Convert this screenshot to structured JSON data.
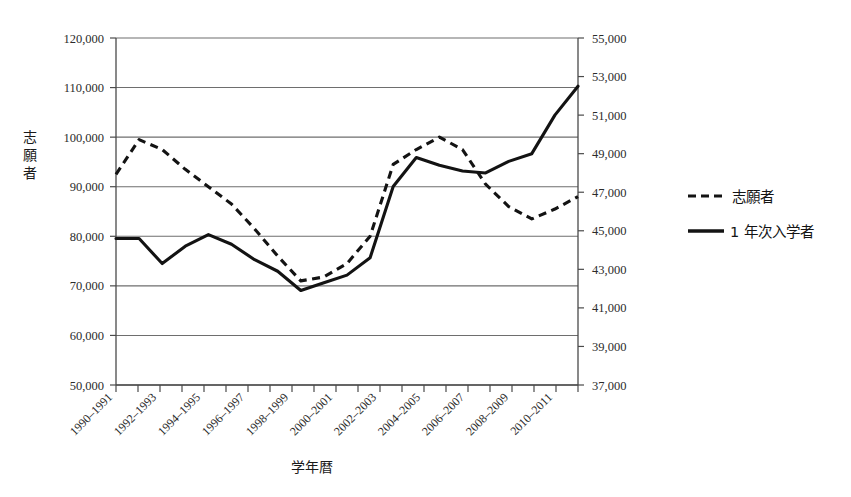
{
  "chart_data": {
    "type": "line",
    "title": "",
    "xlabel": "学年暦",
    "ylabel": "志願者",
    "ylabel_right": "",
    "grid": true,
    "legend_position": "right",
    "x": [
      "1990-1991",
      "1991-1992",
      "1992-1993",
      "1993-1994",
      "1994-1995",
      "1995-1996",
      "1996-1997",
      "1997-1998",
      "1998-1999",
      "1999-2000",
      "2000-2001",
      "2001-2002",
      "2002-2003",
      "2003-2004",
      "2004-2005",
      "2005-2006",
      "2006-2007",
      "2007-2008",
      "2008-2009",
      "2009-2010",
      "2010-2011"
    ],
    "xtick_labels": [
      "1990–1991",
      "1992–1993",
      "1994–1995",
      "1996–1997",
      "1998–1999",
      "2000–2001",
      "2002–2003",
      "2004–2005",
      "2006–2007",
      "2008–2009",
      "2010–2011"
    ],
    "ylim": [
      50000,
      120000
    ],
    "yticks": [
      "50,000",
      "60,000",
      "70,000",
      "80,000",
      "90,000",
      "100,000",
      "110,000",
      "120,000"
    ],
    "ylim_right": [
      37000,
      55000
    ],
    "yticks_right": [
      "37,000",
      "39,000",
      "41,000",
      "43,000",
      "45,000",
      "47,000",
      "49,000",
      "51,000",
      "53,000",
      "55,000"
    ],
    "series": [
      {
        "name": "志願者",
        "style": "dashed",
        "axis": "left",
        "values": [
          92500,
          99500,
          97500,
          93500,
          90000,
          86500,
          81500,
          76000,
          71000,
          71800,
          74500,
          80000,
          94500,
          97500,
          100000,
          97500,
          90500,
          86000,
          83500,
          85500,
          88000
        ]
      },
      {
        "name": "1 年次入学者",
        "style": "solid",
        "axis": "right",
        "values": [
          44600,
          44600,
          43300,
          44200,
          44800,
          44300,
          43500,
          42900,
          41900,
          42300,
          42700,
          43600,
          47300,
          48800,
          48400,
          48100,
          48000,
          48600,
          49000,
          51000,
          52500
        ],
        "values_left_equivalent": [
          77500,
          77500,
          72500,
          76000,
          78300,
          76300,
          73000,
          71000,
          70300,
          71800,
          74800,
          78200,
          94200,
          96000,
          94800,
          93500,
          93200,
          95500,
          97000,
          105000,
          110000
        ]
      }
    ],
    "legend": [
      {
        "label": "志願者",
        "style": "dashed"
      },
      {
        "label": "1 年次入学者",
        "style": "solid"
      }
    ]
  }
}
